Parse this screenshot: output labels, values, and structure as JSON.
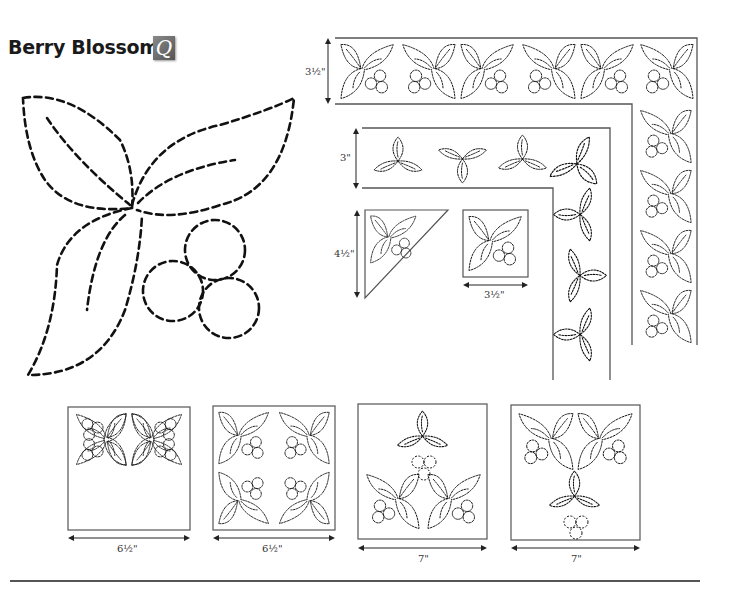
{
  "page": {
    "title": "Berry Blossom",
    "badge_letter": "Q"
  },
  "borders": {
    "outer_border_width": "3½\"",
    "inner_border_width": "3\"",
    "corner_triangle_height": "4½\"",
    "small_block_width": "3½\""
  },
  "blocks": [
    {
      "name": "four-motif-block-inward",
      "width": "6½\""
    },
    {
      "name": "four-motif-block-outward",
      "width": "6½\""
    },
    {
      "name": "three-motif-block-berries-center",
      "width": "7\""
    },
    {
      "name": "three-motif-block-berries-out",
      "width": "7\""
    }
  ],
  "colors": {
    "stitch_line": "#111111",
    "frame_line": "#555555",
    "badge": "#6e6e6e"
  }
}
